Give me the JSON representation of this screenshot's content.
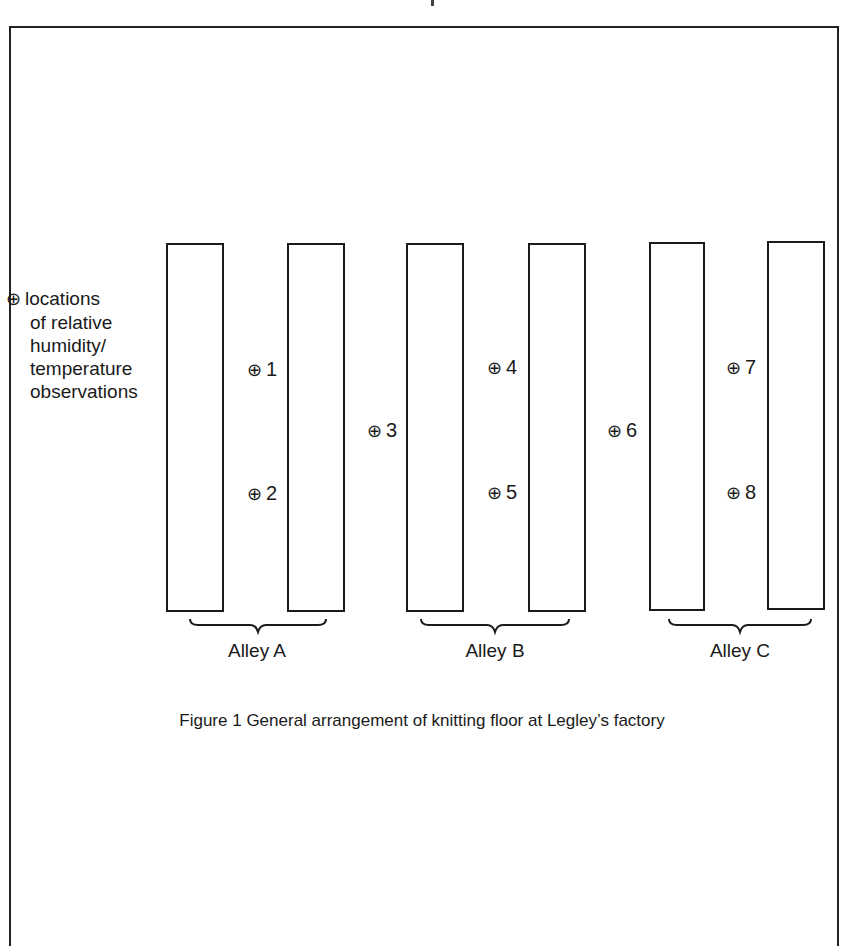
{
  "figure": {
    "caption": "Figure 1  General arrangement of knitting floor at Legley’s factory",
    "legend": {
      "symbol": "⊕",
      "lines": [
        "locations",
        "of relative",
        "humidity/",
        "temperature",
        "observations"
      ]
    },
    "alleys": [
      {
        "label": "Alley A"
      },
      {
        "label": "Alley B"
      },
      {
        "label": "Alley C"
      }
    ],
    "observation_points": [
      {
        "symbol": "⊕",
        "label": "1"
      },
      {
        "symbol": "⊕",
        "label": "2"
      },
      {
        "symbol": "⊕",
        "label": "3"
      },
      {
        "symbol": "⊕",
        "label": "4"
      },
      {
        "symbol": "⊕",
        "label": "5"
      },
      {
        "symbol": "⊕",
        "label": "6"
      },
      {
        "symbol": "⊕",
        "label": "7"
      },
      {
        "symbol": "⊕",
        "label": "8"
      }
    ]
  }
}
